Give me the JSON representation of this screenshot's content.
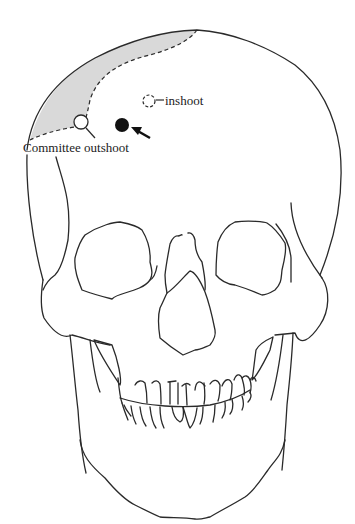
{
  "figure": {
    "labels": {
      "inshoot": "inshoot",
      "committee_outshoot": "Committee outshoot"
    },
    "markers": [
      {
        "name": "inshoot",
        "style": "dashed-open-circle"
      },
      {
        "name": "committee-outshoot",
        "style": "open-circle"
      },
      {
        "name": "actual-wound",
        "style": "filled-circle-with-arrow"
      }
    ],
    "colors": {
      "line": "#2a2a2a",
      "shaded_region": "#d9d9d9",
      "background": "#ffffff"
    }
  }
}
